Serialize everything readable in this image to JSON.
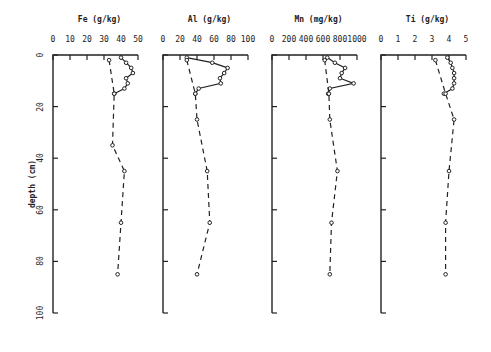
{
  "chart_data": {
    "type": "line",
    "layout": "four vertical depth-profile panels sharing a depth axis",
    "ylabel": "depth (cm)",
    "y_ticks": [
      0,
      20,
      40,
      60,
      80,
      100
    ],
    "ylim": [
      0,
      100
    ],
    "y_inverted": true,
    "grid": false,
    "legend": null,
    "panels": [
      {
        "title": "Fe (g/kg)",
        "x_ticks": [
          0,
          10,
          20,
          30,
          40,
          50
        ],
        "xlim": [
          0,
          50
        ],
        "series": [
          {
            "name": "solid profile",
            "style": "solid",
            "depth": [
              1,
              3,
              5,
              7,
              9,
              11,
              13,
              15
            ],
            "values": [
              40,
              43,
              46,
              47,
              43,
              44,
              42,
              36
            ]
          },
          {
            "name": "dashed profile",
            "style": "dashed",
            "depth": [
              2,
              15,
              35,
              45,
              65,
              85
            ],
            "values": [
              33,
              36,
              35,
              42,
              40,
              38
            ]
          }
        ]
      },
      {
        "title": "Al (g/kg)",
        "x_ticks": [
          0,
          20,
          40,
          60,
          80,
          100
        ],
        "xlim": [
          0,
          100
        ],
        "series": [
          {
            "name": "solid profile",
            "style": "solid",
            "depth": [
              1,
              3,
              5,
              7,
              9,
              11,
              13,
              15
            ],
            "values": [
              28,
              58,
              76,
              72,
              67,
              68,
              42,
              38
            ]
          },
          {
            "name": "dashed profile",
            "style": "dashed",
            "depth": [
              2,
              15,
              25,
              45,
              65,
              85
            ],
            "values": [
              28,
              38,
              40,
              52,
              55,
              40
            ]
          }
        ]
      },
      {
        "title": "Mn (mg/kg)",
        "x_ticks": [
          0,
          200,
          400,
          600,
          800,
          1000
        ],
        "xlim": [
          0,
          1000
        ],
        "series": [
          {
            "name": "solid profile",
            "style": "solid",
            "depth": [
              1,
              3,
              5,
              7,
              9,
              11,
              13,
              15
            ],
            "values": [
              650,
              740,
              860,
              820,
              800,
              960,
              680,
              660
            ]
          },
          {
            "name": "dashed profile",
            "style": "dashed",
            "depth": [
              2,
              15,
              25,
              45,
              65,
              85
            ],
            "values": [
              620,
              670,
              680,
              770,
              700,
              680
            ]
          }
        ]
      },
      {
        "title": "Ti (g/kg)",
        "x_ticks": [
          0,
          1,
          2,
          3,
          4,
          5
        ],
        "xlim": [
          0,
          5
        ],
        "series": [
          {
            "name": "solid profile",
            "style": "solid",
            "depth": [
              1,
              3,
              5,
              7,
              9,
              11,
              13,
              15
            ],
            "values": [
              3.9,
              4.1,
              4.2,
              4.3,
              4.3,
              4.3,
              4.2,
              3.7
            ]
          },
          {
            "name": "dashed profile",
            "style": "dashed",
            "depth": [
              2,
              15,
              25,
              45,
              65,
              85
            ],
            "values": [
              3.2,
              3.8,
              4.3,
              4.0,
              3.8,
              3.8
            ]
          }
        ]
      }
    ]
  },
  "axis": {
    "ylabel": "depth (cm)",
    "y_tick_labels": [
      "0",
      "20",
      "40",
      "60",
      "80",
      "100"
    ]
  },
  "panels": [
    {
      "title": "Fe (g/kg)",
      "tick_labels": [
        "0",
        "10",
        "20",
        "30",
        "40",
        "50"
      ]
    },
    {
      "title": "Al (g/kg)",
      "tick_labels": [
        "0",
        "20",
        "40",
        "60",
        "80",
        "100"
      ]
    },
    {
      "title": "Mn (mg/kg)",
      "tick_labels": [
        "0",
        "200",
        "400",
        "600",
        "800",
        "1000"
      ]
    },
    {
      "title": "Ti (g/kg)",
      "tick_labels": [
        "0",
        "1",
        "2",
        "3",
        "4",
        "5"
      ]
    }
  ]
}
